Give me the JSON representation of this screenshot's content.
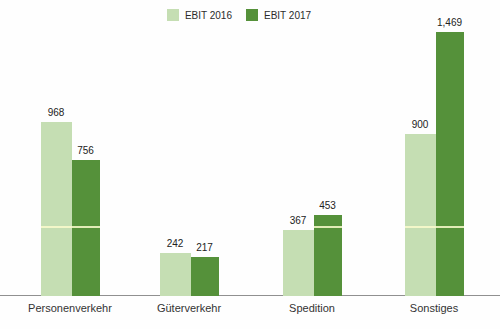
{
  "chart_data": {
    "type": "bar",
    "title": "",
    "categories": [
      "Personenverkehr",
      "Güterverkehr",
      "Spedition",
      "Sonstiges"
    ],
    "series": [
      {
        "name": "EBIT 2016",
        "color": "#c5deb3",
        "values": [
          968,
          242,
          367,
          900
        ],
        "labels": [
          "968",
          "242",
          "367",
          "900"
        ]
      },
      {
        "name": "EBIT 2017",
        "color": "#55913a",
        "values": [
          756,
          217,
          453,
          1469
        ],
        "labels": [
          "756",
          "217",
          "453",
          "1,469"
        ]
      }
    ],
    "xlabel": "",
    "ylabel": "",
    "ylim": [
      0,
      1469
    ],
    "grid": false,
    "legend_position": "top",
    "axis_color": "#909090",
    "scan_artifact_line_color": "#faf5cd"
  }
}
